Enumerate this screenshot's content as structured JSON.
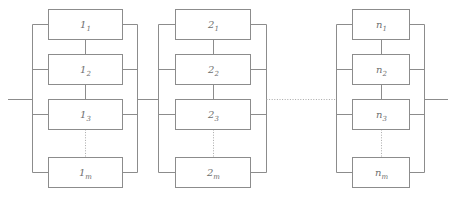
{
  "diagram": {
    "type": "reliability-block-diagram",
    "colors": {
      "background": "#ffffff",
      "line": "#8c8c8c",
      "dotted_line": "#a8a8a8",
      "text": "#6f6f6f",
      "block_fill": "#ffffff"
    },
    "groups": [
      {
        "id": "group-1",
        "index_label": "1",
        "blocks": [
          {
            "id": "block-1-1",
            "base": "1",
            "subscript": "1"
          },
          {
            "id": "block-1-2",
            "base": "1",
            "subscript": "2"
          },
          {
            "id": "block-1-3",
            "base": "1",
            "subscript": "3"
          },
          {
            "id": "block-1-m",
            "base": "1",
            "subscript": "m"
          }
        ]
      },
      {
        "id": "group-2",
        "index_label": "2",
        "blocks": [
          {
            "id": "block-2-1",
            "base": "2",
            "subscript": "1"
          },
          {
            "id": "block-2-2",
            "base": "2",
            "subscript": "2"
          },
          {
            "id": "block-2-3",
            "base": "2",
            "subscript": "3"
          },
          {
            "id": "block-2-m",
            "base": "2",
            "subscript": "m"
          }
        ]
      },
      {
        "id": "group-n",
        "index_label": "n",
        "blocks": [
          {
            "id": "block-n-1",
            "base": "n",
            "subscript": "1"
          },
          {
            "id": "block-n-2",
            "base": "n",
            "subscript": "2"
          },
          {
            "id": "block-n-3",
            "base": "n",
            "subscript": "3"
          },
          {
            "id": "block-n-m",
            "base": "n",
            "subscript": "m"
          }
        ]
      }
    ],
    "ellipsis": {
      "horizontal_between_groups": "dotted",
      "vertical_within_group": "dotted"
    },
    "leads": {
      "input": "left terminal lead",
      "output": "right terminal lead"
    }
  }
}
